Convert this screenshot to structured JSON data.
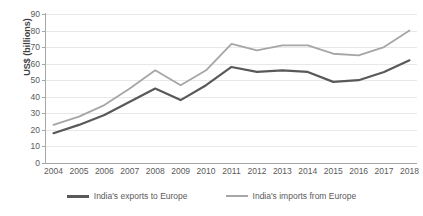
{
  "chart_data": {
    "type": "line",
    "title": "",
    "xlabel": "",
    "ylabel": "US$ (billions)",
    "ylim": [
      0,
      90
    ],
    "ytick_step": 10,
    "yticks": [
      "90",
      "80",
      "70",
      "60",
      "50",
      "40",
      "30",
      "20",
      "10",
      "0"
    ],
    "grid": true,
    "grid_axis": "y",
    "legend_position": "bottom",
    "categories": [
      "2004",
      "2005",
      "2006",
      "2007",
      "2008",
      "2009",
      "2010",
      "2011",
      "2012",
      "2013",
      "2014",
      "2015",
      "2016",
      "2017",
      "2018"
    ],
    "series": [
      {
        "name": "India's exports to Europe",
        "color": "#595959",
        "line_width": 2.2,
        "values": [
          18,
          23,
          29,
          37,
          45,
          38,
          47,
          58,
          55,
          56,
          55,
          49,
          50,
          55,
          62
        ]
      },
      {
        "name": "India's imports from Europe",
        "color": "#a6a6a6",
        "line_width": 1.8,
        "values": [
          23,
          28,
          35,
          45,
          56,
          47,
          56,
          72,
          68,
          71,
          71,
          66,
          65,
          70,
          80
        ]
      }
    ]
  },
  "axes": {
    "y_axis_title": "US$ (billions)",
    "axis_color": "#a6a6a6",
    "gridline_color": "#e8e8e8",
    "tick_label_color": "#5a5a5a"
  },
  "legend": {
    "items": [
      {
        "label": "India's exports to Europe",
        "color": "#595959"
      },
      {
        "label": "India's imports from Europe",
        "color": "#a6a6a6"
      }
    ]
  }
}
